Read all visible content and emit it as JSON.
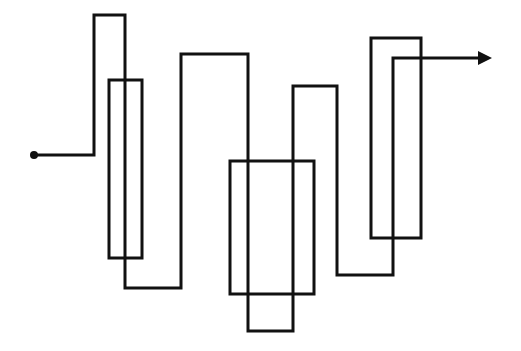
{
  "diagram": {
    "width": 521,
    "height": 351,
    "background": "#ffffff",
    "stroke_color": "#111111",
    "stroke_width": 3,
    "start_dot": {
      "cx": 34,
      "cy": 155,
      "r": 4
    },
    "path_points": [
      [
        34,
        155
      ],
      [
        94,
        155
      ],
      [
        94,
        15
      ],
      [
        125,
        15
      ],
      [
        125,
        288
      ],
      [
        181,
        288
      ],
      [
        181,
        54
      ],
      [
        248,
        54
      ],
      [
        248,
        331
      ],
      [
        293,
        331
      ],
      [
        293,
        86
      ],
      [
        337,
        86
      ],
      [
        337,
        275
      ],
      [
        393,
        275
      ],
      [
        393,
        58
      ],
      [
        480,
        58
      ]
    ],
    "arrow_head": [
      [
        478,
        51
      ],
      [
        492,
        58
      ],
      [
        478,
        65
      ]
    ],
    "rectangles": [
      {
        "x": 109,
        "y": 80,
        "w": 33,
        "h": 178
      },
      {
        "x": 230,
        "y": 161,
        "w": 84,
        "h": 133
      },
      {
        "x": 371,
        "y": 38,
        "w": 50,
        "h": 200
      }
    ]
  }
}
